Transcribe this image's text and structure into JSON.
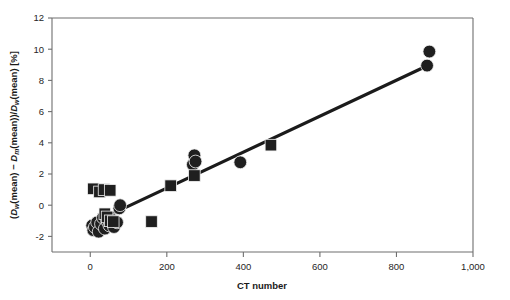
{
  "chart_data": {
    "type": "scatter",
    "title": "",
    "xlabel": "CT number",
    "ylabel": "(Dw(mean) − Dm(mean))/Dw(mean) [%]",
    "ylabel_parts": {
      "open": "(",
      "d1": "D",
      "d1_sub": "w",
      "d1_arg": "(mean) − ",
      "d2": "D",
      "d2_sub": "m",
      "d2_arg": "(mean))/",
      "d3": "D",
      "d3_sub": "w",
      "d3_arg": "(mean) [%]"
    },
    "xlim": [
      -100,
      1000
    ],
    "ylim": [
      -3,
      12
    ],
    "xticks": [
      0,
      200,
      400,
      600,
      800,
      1000
    ],
    "xtick_labels": [
      "0",
      "200",
      "400",
      "600",
      "800",
      "1,000"
    ],
    "yticks": [
      -2,
      0,
      2,
      4,
      6,
      8,
      10,
      12
    ],
    "ytick_labels": [
      "-2",
      "0",
      "2",
      "4",
      "6",
      "8",
      "10",
      "12"
    ],
    "grid": false,
    "legend": null,
    "marker_color": "#1f1f1f",
    "line_color": "#1b1b1b",
    "axis_color": "#6e6e6e",
    "series": [
      {
        "name": "circles",
        "marker": "circle",
        "points": [
          [
            5,
            -1.3
          ],
          [
            8,
            -1.6
          ],
          [
            12,
            -1.4
          ],
          [
            18,
            -1.1
          ],
          [
            22,
            -1.7
          ],
          [
            28,
            -1.2
          ],
          [
            33,
            -0.8
          ],
          [
            38,
            -1.5
          ],
          [
            44,
            -1.0
          ],
          [
            50,
            -1.3
          ],
          [
            56,
            -0.9
          ],
          [
            62,
            -1.4
          ],
          [
            70,
            -1.1
          ],
          [
            76,
            -0.2
          ],
          [
            78,
            0.0
          ],
          [
            268,
            2.6
          ],
          [
            272,
            3.2
          ],
          [
            275,
            2.8
          ],
          [
            392,
            2.75
          ],
          [
            880,
            8.95
          ],
          [
            886,
            9.85
          ]
        ]
      },
      {
        "name": "squares",
        "marker": "square",
        "points": [
          [
            8,
            1.05
          ],
          [
            24,
            0.85
          ],
          [
            36,
            1.0
          ],
          [
            52,
            0.95
          ],
          [
            38,
            -0.55
          ],
          [
            44,
            -0.75
          ],
          [
            52,
            -1.0
          ],
          [
            60,
            -1.05
          ],
          [
            160,
            -1.05
          ],
          [
            210,
            1.25
          ],
          [
            272,
            1.9
          ],
          [
            472,
            3.85
          ]
        ]
      }
    ],
    "trendline": {
      "x0": 40,
      "y0": -0.75,
      "x1": 886,
      "y1": 9.0
    }
  }
}
